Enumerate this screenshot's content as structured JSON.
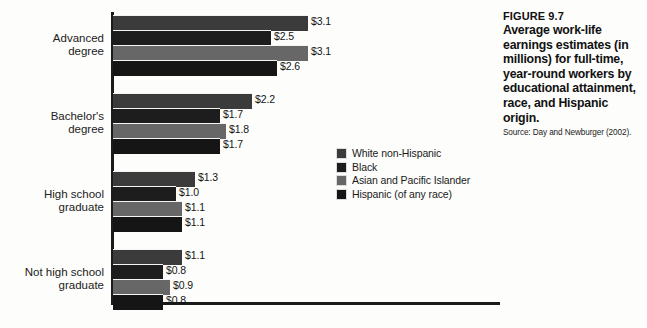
{
  "chart_data": {
    "type": "bar",
    "orientation": "horizontal",
    "title": "Average work-life earnings estimates (in millions) for full-time, year-round workers by educational attainment, race, and Hispanic origin.",
    "figure_number": "FIGURE 9.7",
    "source": "Source: Day and Newburger (2002).",
    "xlabel": "",
    "ylabel": "",
    "xlim": [
      0,
      3.5
    ],
    "grid": false,
    "legend_position": "center",
    "categories": [
      "Advanced\ndegree",
      "Bachelor's\ndegree",
      "High school\ngraduate",
      "Not high school\ngraduate"
    ],
    "series": [
      {
        "name": "White non-Hispanic",
        "color": "#3b3b3b",
        "values": [
          3.1,
          2.2,
          1.3,
          1.1
        ],
        "labels": [
          "$3.1",
          "$2.2",
          "$1.3",
          "$1.1"
        ]
      },
      {
        "name": "Black",
        "color": "#1d1d1d",
        "values": [
          2.5,
          1.7,
          1.0,
          0.8
        ],
        "labels": [
          "$2.5",
          "$1.7",
          "$1.0",
          "$0.8"
        ]
      },
      {
        "name": "Asian and Pacific Islander",
        "color": "#676767",
        "values": [
          3.1,
          1.8,
          1.1,
          0.9
        ],
        "labels": [
          "$3.1",
          "$1.8",
          "$1.1",
          "$0.9"
        ]
      },
      {
        "name": "Hispanic (of any race)",
        "color": "#151515",
        "values": [
          2.6,
          1.7,
          1.1,
          0.8
        ],
        "labels": [
          "$2.6",
          "$1.7",
          "$1.1",
          "$0.8"
        ]
      }
    ]
  },
  "legend": {
    "items": [
      {
        "label": "White non-Hispanic",
        "color": "#3b3b3b"
      },
      {
        "label": "Black",
        "color": "#1d1d1d"
      },
      {
        "label": "Asian and Pacific Islander",
        "color": "#676767"
      },
      {
        "label": "Hispanic (of any race)",
        "color": "#151515"
      }
    ]
  },
  "caption": {
    "figure_number": "FIGURE 9.7",
    "title": "Average work-life earnings estimates (in millions) for full-time, year-round workers by educational attainment, race, and Hispanic origin.",
    "source": "Source: Day and Newburger (2002)."
  },
  "axis": {
    "line_color": "#1b1b1b"
  }
}
